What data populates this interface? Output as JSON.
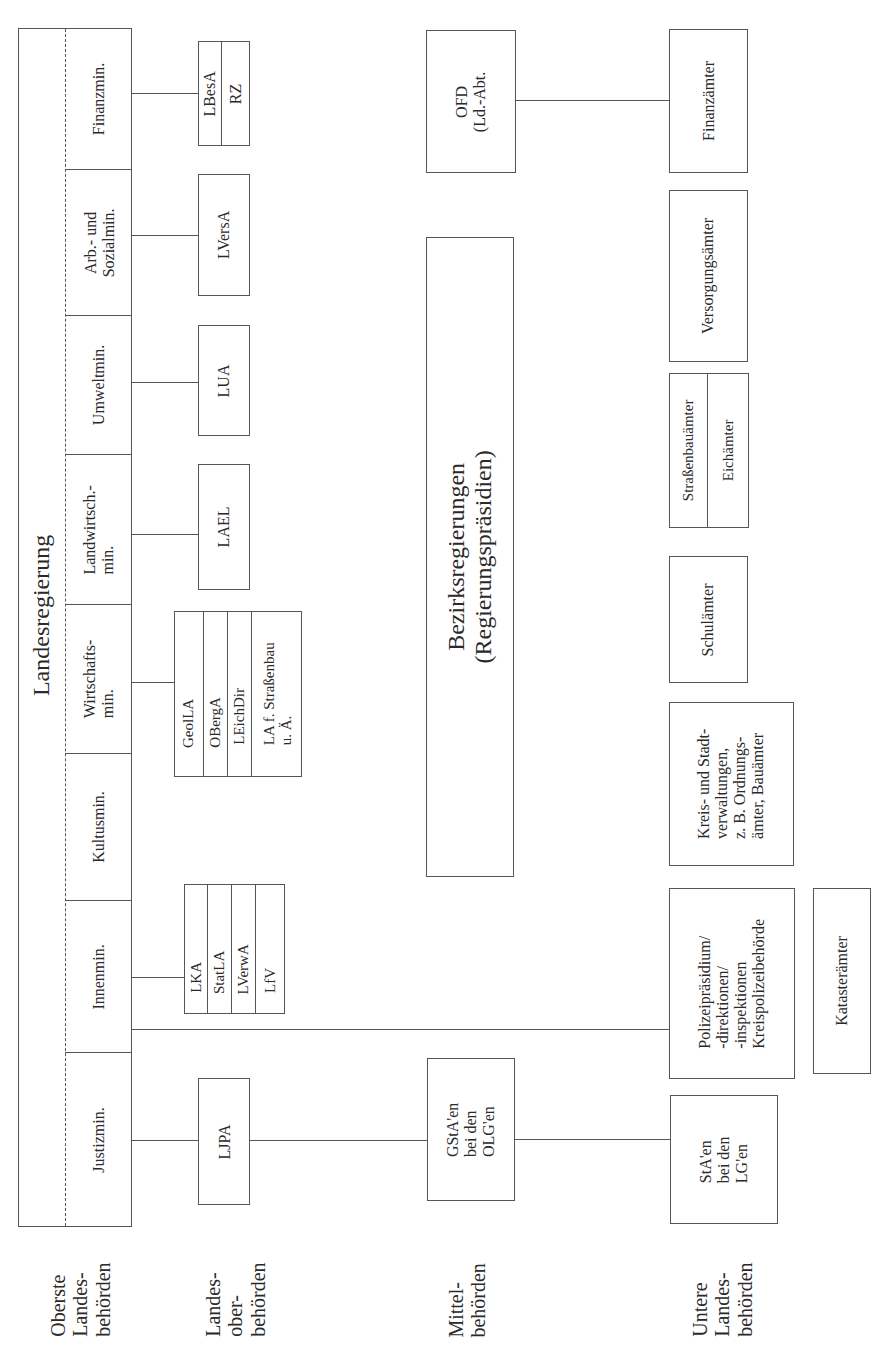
{
  "levels": {
    "oberste": [
      "Oberste",
      "Landes-",
      "behörden"
    ],
    "landesober": [
      "Landes-",
      "ober-",
      "behörden"
    ],
    "mittel": [
      "Mittel-",
      "behörden"
    ],
    "untere": [
      "Untere",
      "Landes-",
      "behörden"
    ]
  },
  "landesregierung": {
    "title": "Landesregierung",
    "ministries": [
      {
        "id": "finanz",
        "lines": [
          "Finanzmin."
        ]
      },
      {
        "id": "arbeit",
        "lines": [
          "Arb.- und",
          "Sozialmin."
        ]
      },
      {
        "id": "umwelt",
        "lines": [
          "Umweltmin."
        ]
      },
      {
        "id": "landwirtschaft",
        "lines": [
          "Landwirtsch.-",
          "min."
        ]
      },
      {
        "id": "wirtschaft",
        "lines": [
          "Wirtschafts-",
          "min."
        ]
      },
      {
        "id": "kultus",
        "lines": [
          "Kultusmin."
        ]
      },
      {
        "id": "innen",
        "lines": [
          "Innenmin."
        ]
      },
      {
        "id": "justiz",
        "lines": [
          "Justizmin."
        ]
      }
    ]
  },
  "landesoberbehoerden": {
    "finanz": [
      "LBesA",
      "RZ"
    ],
    "arbeit": "LVersA",
    "umwelt": "LUA",
    "landwirtschaft": "LAEL",
    "wirtschaft": [
      "GeolLA",
      "OBergA",
      "LEichDir",
      "LA f. Straßenbau u. Ä."
    ],
    "wirtschaft_last_lines": [
      "LA f. Straßenbau",
      "u. Ä."
    ],
    "innen": [
      "LKA",
      "StatLA",
      "LVerwA",
      "LfV"
    ],
    "justiz": "LJPA"
  },
  "mittelbehoerden": {
    "ofd": [
      "OFD",
      "(Ld.-Abt."
    ],
    "bezirksregierungen": [
      "Bezirksregierungen",
      "(Regierungspräsidien)"
    ],
    "gsta": [
      "GStA'en",
      "bei den",
      "OLG'en"
    ]
  },
  "untere": {
    "finanzaemter": "Finanzämter",
    "versorgungsaemter": "Versorgungsämter",
    "strassenbau_eich": [
      "Straßenbauämter",
      "Eichämter"
    ],
    "schulaemter": "Schulämter",
    "kreis_stadt": [
      "Kreis- und Stadt-",
      "verwaltungen,",
      "z. B. Ordnungs-",
      "ämter, Bauämter"
    ],
    "polizei": [
      "Polizeipräsidium/",
      "-direktionen/",
      "-inspektionen",
      "Kreispolizeibehörde"
    ],
    "kataster": "Katasterämter",
    "sta": [
      "StA'en",
      "bei den",
      "LG'en"
    ]
  }
}
